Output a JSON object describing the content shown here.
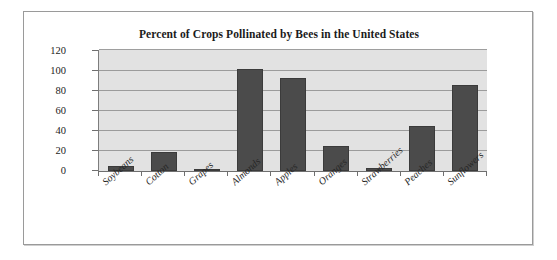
{
  "chart_data": {
    "type": "bar",
    "title": "Percent of Crops Pollinated by Bees in the United States",
    "xlabel": "",
    "ylabel": "",
    "ylim": [
      0,
      120
    ],
    "ytick_step": 20,
    "yticks": [
      "120",
      "100",
      "80",
      "60",
      "40",
      "20",
      "0"
    ],
    "grid": true,
    "legend": false,
    "categories": [
      "Soybeans",
      "Cotton",
      "Grapes",
      "Almonds",
      "Apples",
      "Oranges",
      "Strawberries",
      "Peaches",
      "Sunflowers"
    ],
    "values": [
      5,
      19,
      2,
      101,
      92,
      25,
      3,
      45,
      85
    ],
    "bar_color": "#4b4b4b",
    "plot_background": "#e2e2e2",
    "gridline_color": "#9b9b9b",
    "axis_color": "#6f6f6f",
    "frame_color": "#9a9a9a"
  }
}
